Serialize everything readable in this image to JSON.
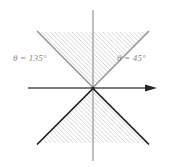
{
  "figure": {
    "width": 173,
    "height": 167,
    "background": "#ffffff"
  },
  "labels": {
    "left": {
      "name": "theta-135-label",
      "symbol": "θ",
      "equals": " = ",
      "value": "135",
      "degree": "°",
      "text": "θ = 135°",
      "color": "#8a8a8a"
    },
    "right": {
      "name": "theta-45-label",
      "symbol": "θ",
      "equals": " = ",
      "value": "45",
      "degree": "°",
      "text": "θ = 45°",
      "color": "#8a8a8a"
    }
  },
  "axes": {
    "origin": {
      "x": 93,
      "y": 88
    },
    "x_axis": {
      "name": "x-axis",
      "x1": 28,
      "y1": 88,
      "x2": 153,
      "y2": 88,
      "color": "#4d4d4d",
      "width": 1.4,
      "arrow_end": "right"
    },
    "y_axis": {
      "name": "y-axis",
      "x1": 93,
      "y1": 10,
      "x2": 93,
      "y2": 160,
      "color": "#9a9a9a",
      "width": 1.3,
      "arrow_end": "none"
    },
    "arrowhead": {
      "tip_x": 157,
      "half_height": 3.6,
      "length": 11,
      "color": "#2b2b2b"
    }
  },
  "regions": [
    {
      "name": "upper-cone",
      "description": "Shaded sector opening upward between 45 and 135 degrees",
      "points": "93,88 38,32 148,32",
      "fill": "none",
      "hatch": true,
      "edge_color": "#9a9a9a",
      "edge_width": 1.6
    },
    {
      "name": "lower-cone",
      "description": "Shaded sector opening downward between 225 and 315 degrees",
      "points": "93,88 38,143 148,143",
      "fill": "none",
      "hatch": true,
      "edge_color": "#1f1f1f",
      "edge_width": 1.6
    }
  ],
  "hatch": {
    "name": "diagonal-hatch-pattern",
    "angle_deg": 45,
    "direction": "up-right",
    "spacing": 3.1,
    "stroke": "#b8b8b8",
    "stroke_width": 0.85
  },
  "boundary_rays": [
    {
      "name": "ray-135-upper",
      "from": "93,88",
      "to": "38,32",
      "color": "#9a9a9a"
    },
    {
      "name": "ray-45-upper",
      "from": "93,88",
      "to": "148,32",
      "color": "#9a9a9a"
    },
    {
      "name": "ray-225-lower",
      "from": "93,88",
      "to": "38,143",
      "color": "#1f1f1f"
    },
    {
      "name": "ray-315-lower",
      "from": "93,88",
      "to": "148,143",
      "color": "#1f1f1f"
    }
  ]
}
